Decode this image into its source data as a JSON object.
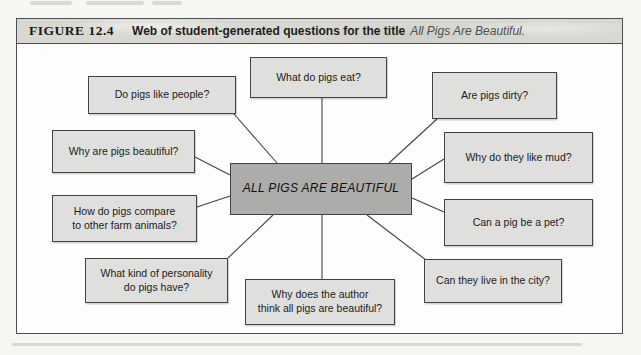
{
  "colors": {
    "page_bg": "#f6f6f2",
    "figure_bg": "#fdfdfb",
    "header_fill": "#d8d8d2",
    "node_fill": "#dfdfdd",
    "center_fill": "#acacaa",
    "line": "#434343",
    "text": "#1c1c1c",
    "caption_title_color": "#4f4f4f"
  },
  "figure": {
    "label": "FIGURE 12.4",
    "caption": "Web of student-generated questions for the title",
    "caption_title": "All Pigs Are Beautiful."
  },
  "diagram": {
    "center": {
      "id": "all-pigs-are-beautiful",
      "label": "ALL PIGS ARE BEAUTIFUL",
      "x": 230,
      "y": 163,
      "w": 182,
      "h": 52
    },
    "nodes": [
      {
        "id": "what-do-pigs-eat",
        "label": "What do pigs eat?",
        "x": 250,
        "y": 57,
        "w": 137,
        "h": 41
      },
      {
        "id": "do-pigs-like-people",
        "label": "Do pigs like people?",
        "x": 88,
        "y": 76,
        "w": 148,
        "h": 38
      },
      {
        "id": "are-pigs-dirty",
        "label": "Are pigs dirty?",
        "x": 432,
        "y": 72,
        "w": 125,
        "h": 47
      },
      {
        "id": "why-are-pigs-beautiful",
        "label": "Why are pigs beautiful?",
        "x": 52,
        "y": 130,
        "w": 143,
        "h": 43
      },
      {
        "id": "why-do-they-like-mud",
        "label": "Why do they like mud?",
        "x": 444,
        "y": 132,
        "w": 149,
        "h": 51
      },
      {
        "id": "how-do-pigs-compare",
        "label": "How do pigs compare\nto other farm animals?",
        "x": 52,
        "y": 195,
        "w": 145,
        "h": 47
      },
      {
        "id": "can-a-pig-be-a-pet",
        "label": "Can a pig be a pet?",
        "x": 444,
        "y": 199,
        "w": 149,
        "h": 47
      },
      {
        "id": "what-kind-of-personality",
        "label": "What kind of personality\ndo pigs have?",
        "x": 85,
        "y": 258,
        "w": 143,
        "h": 45
      },
      {
        "id": "why-does-the-author",
        "label": "Why does the author\nthink all pigs are beautiful?",
        "x": 245,
        "y": 279,
        "w": 150,
        "h": 46
      },
      {
        "id": "can-they-live-in-the-city",
        "label": "Can they live in the city?",
        "x": 424,
        "y": 259,
        "w": 138,
        "h": 44
      }
    ],
    "edges": [
      [
        322,
        98,
        322,
        163
      ],
      [
        234,
        114,
        277,
        163
      ],
      [
        437,
        119,
        389,
        163
      ],
      [
        195,
        157,
        230,
        175
      ],
      [
        197,
        207,
        230,
        196
      ],
      [
        273,
        215,
        228,
        258
      ],
      [
        322,
        215,
        322,
        279
      ],
      [
        367,
        215,
        426,
        260
      ],
      [
        412,
        198,
        444,
        212
      ],
      [
        412,
        179,
        444,
        159
      ]
    ]
  }
}
